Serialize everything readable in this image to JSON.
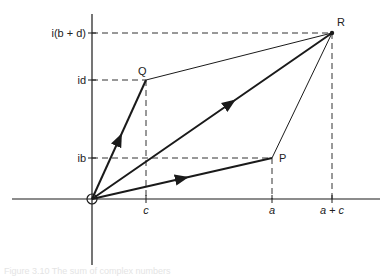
{
  "diagram": {
    "points": {
      "O": {
        "label": "",
        "x": 92,
        "y": 199
      },
      "P": {
        "label": "P",
        "x": 272,
        "y": 158
      },
      "Q": {
        "label": "Q",
        "x": 146,
        "y": 80
      },
      "R": {
        "label": "R",
        "x": 332,
        "y": 33
      }
    },
    "x_axis_ticks": [
      {
        "label": "c",
        "x": 146
      },
      {
        "label": "a",
        "x": 272
      },
      {
        "label": "a + c",
        "x": 332
      }
    ],
    "y_axis_ticks": [
      {
        "label": "i(b + d)",
        "y": 33
      },
      {
        "label": "id",
        "y": 80
      },
      {
        "label": "ib",
        "y": 158
      }
    ],
    "vectors": [
      "OP",
      "OQ",
      "OR"
    ],
    "sides": [
      "QR",
      "PR"
    ],
    "colors": {
      "stroke": "#1a1a1a",
      "dash": "#333333"
    },
    "caption": "Figure 3.10  The sum of complex numbers"
  }
}
